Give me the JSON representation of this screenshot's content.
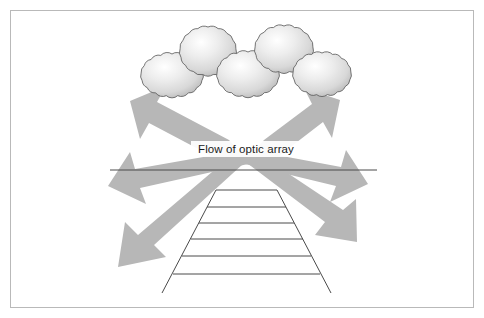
{
  "figure": {
    "title_label": "Flow of optic array",
    "frame": {
      "border_color": "#b9b9b9",
      "background_color": "#ffffff",
      "x": 10,
      "y": 10,
      "width": 464,
      "height": 298
    }
  },
  "labels": {
    "flow_of_optic_array": "Flow of optic array"
  },
  "colors": {
    "arrow_fill": "#b7b7b7",
    "arrow_stroke": "#b7b7b7",
    "bush_stroke": "#555555",
    "bush_light": "#ffffff",
    "bush_mid": "#e3e3e3",
    "bush_dark": "#b4b4b4",
    "line_color": "#4a4a4a",
    "frame_color": "#b9b9b9",
    "text_color": "#1a1a1a",
    "background": "#ffffff"
  },
  "bushes": [
    {
      "name": "bush-left-front",
      "cx": 172,
      "cy": 75,
      "rx": 31,
      "ry": 21,
      "lobes": 17
    },
    {
      "name": "bush-left-back",
      "cx": 208,
      "cy": 51,
      "rx": 28,
      "ry": 24,
      "lobes": 17
    },
    {
      "name": "bush-center-front",
      "cx": 248,
      "cy": 74,
      "rx": 31,
      "ry": 22,
      "lobes": 17
    },
    {
      "name": "bush-right-back",
      "cx": 284,
      "cy": 49,
      "rx": 29,
      "ry": 23,
      "lobes": 17
    },
    {
      "name": "bush-right-front",
      "cx": 322,
      "cy": 74,
      "rx": 29,
      "ry": 21,
      "lobes": 17
    }
  ],
  "horizon": {
    "name": "horizon-line",
    "x1": 110,
    "y1": 170,
    "x2": 377,
    "y2": 170
  },
  "track": {
    "name": "railroad-track",
    "top_left_x": 216,
    "top_right_x": 277,
    "top_y": 190,
    "bottom_left_x": 162,
    "bottom_right_x": 331,
    "bottom_y": 293,
    "rung_count": 6,
    "rungs_y": [
      190,
      207,
      222,
      238,
      255,
      273
    ]
  },
  "arrows": {
    "origin_x": 245,
    "origin_y": 155,
    "count": 6,
    "items": [
      {
        "name": "arrow-up-left",
        "tip_x": 133,
        "tip_y": 103,
        "tail_x": 236,
        "tail_y": 150
      },
      {
        "name": "arrow-up-right",
        "tip_x": 330,
        "tip_y": 101,
        "tail_x": 258,
        "tail_y": 148
      },
      {
        "name": "arrow-left",
        "tip_x": 113,
        "tip_y": 185,
        "tail_x": 232,
        "tail_y": 157
      },
      {
        "name": "arrow-right",
        "tip_x": 362,
        "tip_y": 182,
        "tail_x": 264,
        "tail_y": 157
      },
      {
        "name": "arrow-down-left",
        "tip_x": 122,
        "tip_y": 263,
        "tail_x": 233,
        "tail_y": 162
      },
      {
        "name": "arrow-down-right",
        "tip_x": 351,
        "tip_y": 236,
        "tail_x": 262,
        "tail_y": 163
      }
    ]
  }
}
